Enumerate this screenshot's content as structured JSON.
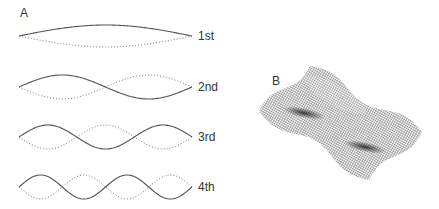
{
  "panel_a": {
    "label": "A",
    "modes": [
      {
        "label": "1st",
        "center_y": 36,
        "amplitude": 11,
        "half_waves": 1
      },
      {
        "label": "2nd",
        "center_y": 87,
        "amplitude": 12,
        "half_waves": 2
      },
      {
        "label": "3rd",
        "center_y": 137,
        "amplitude": 12,
        "half_waves": 3
      },
      {
        "label": "4th",
        "center_y": 187,
        "amplitude": 12,
        "half_waves": 4
      }
    ],
    "x_start": 19,
    "x_end": 192,
    "solid_color": "#555555",
    "dotted_color": "#777777"
  },
  "panel_b": {
    "label": "B",
    "description": "mesh surface standing wave"
  }
}
